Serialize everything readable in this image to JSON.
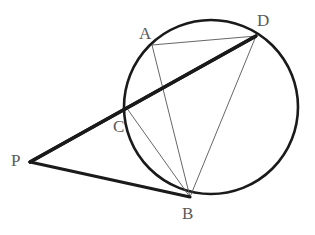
{
  "figure": {
    "kind": "geometry-diagram",
    "background_color": "#ffffff",
    "canvas": {
      "width": 315,
      "height": 235
    },
    "stroke_colors": {
      "thick_line": "#1a1a1a",
      "thin_line": "#555555",
      "circle": "#1a1a1a",
      "label": "#595959"
    },
    "stroke_widths": {
      "thick_line": 3.2,
      "thin_line": 0.9,
      "circle": 2.6
    },
    "circle": {
      "name": "main-circle",
      "cx": 211,
      "cy": 107,
      "r": 87
    },
    "points": [
      {
        "id": "P",
        "label": "P",
        "x": 30,
        "y": 162,
        "label_x": 11,
        "label_y": 152,
        "on_circle": false
      },
      {
        "id": "A",
        "label": "A",
        "x": 152,
        "y": 45,
        "label_x": 139,
        "label_y": 25,
        "on_circle": true
      },
      {
        "id": "C",
        "label": "C",
        "x": 126,
        "y": 107,
        "label_x": 113,
        "label_y": 118,
        "on_circle": true
      },
      {
        "id": "D",
        "label": "D",
        "x": 256,
        "y": 36,
        "label_x": 257,
        "label_y": 12,
        "on_circle": true
      },
      {
        "id": "B",
        "label": "B",
        "x": 190,
        "y": 197,
        "label_x": 182,
        "label_y": 205,
        "on_circle": true
      }
    ],
    "thick_segments": [
      {
        "id": "PAD",
        "from": "P",
        "to": "D",
        "via": "A",
        "note": "secant through A and D"
      },
      {
        "id": "PCD",
        "from": "P",
        "to": "D",
        "via": "C",
        "note": "secant through C and D"
      },
      {
        "id": "PB",
        "from": "P",
        "to": "B",
        "via": "",
        "note": "tangent to circle at B"
      }
    ],
    "thin_segments": [
      {
        "id": "AD",
        "from": "A",
        "to": "D",
        "note": "chord A to D"
      },
      {
        "id": "AB",
        "from": "A",
        "to": "B",
        "note": "chord A to B"
      },
      {
        "id": "CB",
        "from": "C",
        "to": "B",
        "note": "chord C to B"
      },
      {
        "id": "DB",
        "from": "D",
        "to": "B",
        "note": "chord D to B"
      }
    ]
  }
}
